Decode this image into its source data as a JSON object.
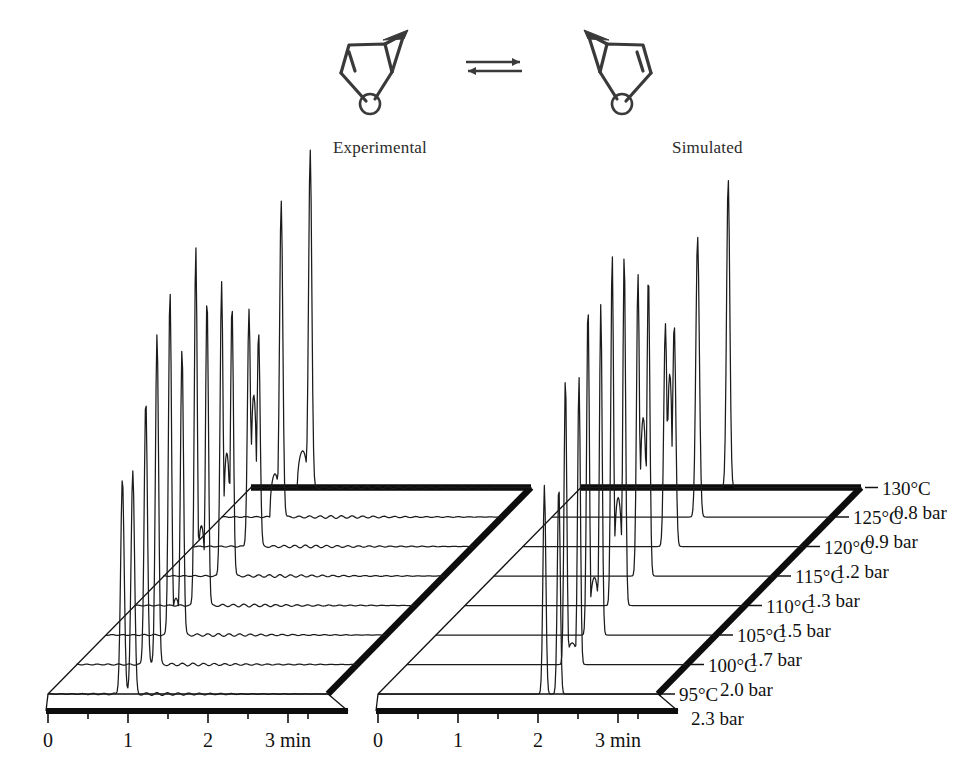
{
  "figure": {
    "scheme": {
      "left_structure_name": "bicyclic-furan-enantiomer-left",
      "right_structure_name": "bicyclic-furan-enantiomer-right",
      "arrow_name": "equilibrium-arrow",
      "oxygen_label": "O"
    },
    "panels": [
      {
        "key": "experimental",
        "label": "Experimental"
      },
      {
        "key": "simulated",
        "label": "Simulated"
      }
    ]
  },
  "chart_data": {
    "type": "line",
    "title": "",
    "subtitle": "",
    "xlabel": "3 min",
    "ylabel": "",
    "xlim": [
      0,
      3.5
    ],
    "x_ticks_major": [
      0,
      1,
      2,
      3
    ],
    "x_tick_labels": [
      "0",
      "1",
      "2",
      "3 min"
    ],
    "x_ticks_minor": [
      0.5,
      1.5,
      2.5,
      3.25
    ],
    "grid": false,
    "legend_position": "none",
    "projection": "stacked-3d-waterfall",
    "stack_count": 8,
    "conditions": [
      {
        "index": 0,
        "temperature": "95°C",
        "pressure": "2.3 bar"
      },
      {
        "index": 1,
        "temperature": "100°C",
        "pressure": "2.0 bar"
      },
      {
        "index": 2,
        "temperature": "105°C",
        "pressure": "1.7 bar"
      },
      {
        "index": 3,
        "temperature": "110°C",
        "pressure": "1.5 bar"
      },
      {
        "index": 4,
        "temperature": "115°C",
        "pressure": "1.3 bar"
      },
      {
        "index": 5,
        "temperature": "120°C",
        "pressure": "1.2 bar"
      },
      {
        "index": 6,
        "temperature": "125°C",
        "pressure": "0.9 bar"
      },
      {
        "index": 7,
        "temperature": "130°C",
        "pressure": "0.8 bar"
      }
    ],
    "series": [
      {
        "name": "Experimental 95°C 2.3 bar",
        "panel": "experimental",
        "stack": 0,
        "peaks": [
          {
            "rt": 0.93,
            "height": 0.6,
            "width": 0.022
          },
          {
            "rt": 1.06,
            "height": 0.62,
            "width": 0.022
          }
        ],
        "plateau": null
      },
      {
        "name": "Experimental 100°C 2.0 bar",
        "panel": "experimental",
        "stack": 1,
        "peaks": [
          {
            "rt": 0.86,
            "height": 0.74,
            "width": 0.02
          },
          {
            "rt": 1.0,
            "height": 0.92,
            "width": 0.02
          }
        ],
        "plateau": null
      },
      {
        "name": "Experimental 105°C 1.7 bar",
        "panel": "experimental",
        "stack": 2,
        "peaks": [
          {
            "rt": 0.8,
            "height": 0.96,
            "width": 0.019
          },
          {
            "rt": 0.95,
            "height": 0.8,
            "width": 0.019
          }
        ],
        "plateau": {
          "from": 0.82,
          "to": 0.93,
          "level": 0.1
        }
      },
      {
        "name": "Experimental 110°C 1.5 bar",
        "panel": "experimental",
        "stack": 3,
        "peaks": [
          {
            "rt": 0.76,
            "height": 1.0,
            "width": 0.018
          },
          {
            "rt": 0.9,
            "height": 0.86,
            "width": 0.018
          }
        ],
        "plateau": {
          "from": 0.78,
          "to": 0.88,
          "level": 0.22
        }
      },
      {
        "name": "Experimental 115°C 1.3 bar",
        "panel": "experimental",
        "stack": 4,
        "peaks": [
          {
            "rt": 0.72,
            "height": 0.82,
            "width": 0.018
          },
          {
            "rt": 0.85,
            "height": 0.76,
            "width": 0.018
          }
        ],
        "plateau": {
          "from": 0.74,
          "to": 0.83,
          "level": 0.34
        }
      },
      {
        "name": "Experimental 120°C 1.2 bar",
        "panel": "experimental",
        "stack": 5,
        "peaks": [
          {
            "rt": 0.7,
            "height": 0.66,
            "width": 0.019
          },
          {
            "rt": 0.82,
            "height": 0.6,
            "width": 0.019
          }
        ],
        "plateau": {
          "from": 0.72,
          "to": 0.8,
          "level": 0.42
        }
      },
      {
        "name": "Experimental 125°C 0.9 bar",
        "panel": "experimental",
        "stack": 6,
        "peaks": [
          {
            "rt": 0.74,
            "height": 0.88,
            "width": 0.02
          }
        ],
        "plateau": {
          "from": 0.6,
          "to": 0.72,
          "level": 0.12
        }
      },
      {
        "name": "Experimental 130°C 0.8 bar",
        "panel": "experimental",
        "stack": 7,
        "peaks": [
          {
            "rt": 0.74,
            "height": 0.94,
            "width": 0.02
          }
        ],
        "plateau": {
          "from": 0.58,
          "to": 0.71,
          "level": 0.1
        }
      },
      {
        "name": "Simulated 95°C 2.3 bar",
        "panel": "simulated",
        "stack": 0,
        "peaks": [
          {
            "rt": 2.08,
            "height": 0.58,
            "width": 0.018
          },
          {
            "rt": 2.26,
            "height": 0.58,
            "width": 0.018
          }
        ],
        "plateau": null
      },
      {
        "name": "Simulated 100°C 2.0 bar",
        "panel": "simulated",
        "stack": 1,
        "peaks": [
          {
            "rt": 1.98,
            "height": 0.8,
            "width": 0.017
          },
          {
            "rt": 2.15,
            "height": 0.8,
            "width": 0.017
          }
        ],
        "plateau": {
          "from": 2.0,
          "to": 2.13,
          "level": 0.06
        }
      },
      {
        "name": "Simulated 105°C 1.7 bar",
        "panel": "simulated",
        "stack": 2,
        "peaks": [
          {
            "rt": 1.9,
            "height": 0.92,
            "width": 0.017
          },
          {
            "rt": 2.06,
            "height": 0.92,
            "width": 0.017
          }
        ],
        "plateau": {
          "from": 1.92,
          "to": 2.04,
          "level": 0.16
        }
      },
      {
        "name": "Simulated 110°C 1.5 bar",
        "panel": "simulated",
        "stack": 3,
        "peaks": [
          {
            "rt": 1.84,
            "height": 0.98,
            "width": 0.017
          },
          {
            "rt": 1.99,
            "height": 0.98,
            "width": 0.017
          }
        ],
        "plateau": {
          "from": 1.86,
          "to": 1.97,
          "level": 0.3
        }
      },
      {
        "name": "Simulated 115°C 1.3 bar",
        "panel": "simulated",
        "stack": 4,
        "peaks": [
          {
            "rt": 1.8,
            "height": 0.84,
            "width": 0.018
          },
          {
            "rt": 1.93,
            "height": 0.84,
            "width": 0.018
          }
        ],
        "plateau": {
          "from": 1.82,
          "to": 1.91,
          "level": 0.44
        }
      },
      {
        "name": "Simulated 120°C 1.2 bar",
        "panel": "simulated",
        "stack": 5,
        "peaks": [
          {
            "rt": 1.78,
            "height": 0.62,
            "width": 0.02
          },
          {
            "rt": 1.89,
            "height": 0.62,
            "width": 0.02
          }
        ],
        "plateau": {
          "from": 1.8,
          "to": 1.87,
          "level": 0.48
        }
      },
      {
        "name": "Simulated 125°C 0.9 bar",
        "panel": "simulated",
        "stack": 6,
        "peaks": [
          {
            "rt": 1.82,
            "height": 0.78,
            "width": 0.022
          }
        ],
        "plateau": null
      },
      {
        "name": "Simulated 130°C 0.8 bar",
        "panel": "simulated",
        "stack": 7,
        "peaks": [
          {
            "rt": 1.84,
            "height": 0.86,
            "width": 0.02
          }
        ],
        "plateau": null
      }
    ],
    "annotations": [
      {
        "text": "Experimental",
        "x": 1.1,
        "panel": "experimental"
      },
      {
        "text": "Simulated",
        "x": 1.1,
        "panel": "simulated"
      }
    ],
    "colors": {
      "trace": "#1b1b1b",
      "axis": "#111111",
      "background": "#ffffff",
      "molecule": "#3a3a3a"
    }
  }
}
